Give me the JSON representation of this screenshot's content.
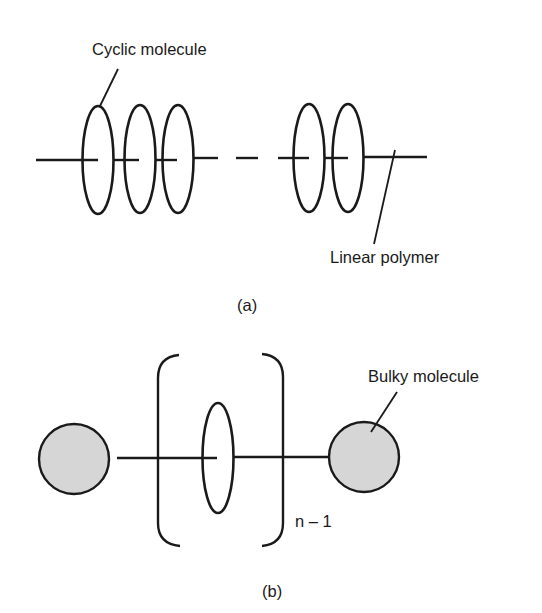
{
  "figure": {
    "panel_a": {
      "caption": "(a)",
      "labels": {
        "cyclic_molecule": "Cyclic molecule",
        "linear_polymer": "Linear polymer"
      },
      "cyclic_count_left": 3,
      "cyclic_count_right": 2
    },
    "panel_b": {
      "caption": "(b)",
      "labels": {
        "bulky_molecule": "Bulky molecule",
        "repeat_subscript": "n – 1"
      },
      "bulky_fill_color": "#d6d6d6"
    },
    "colors": {
      "line": "#1a1a1a",
      "background": "#ffffff"
    }
  }
}
